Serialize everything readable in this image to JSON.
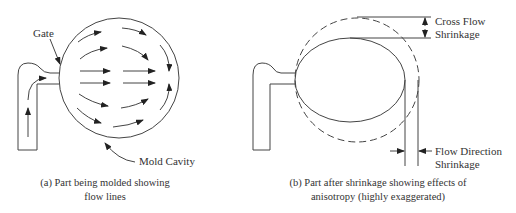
{
  "panel_a": {
    "labels": {
      "gate": "Gate",
      "mold_cavity": "Mold Cavity"
    },
    "caption_line1": "(a) Part being molded showing",
    "caption_line2": "flow lines"
  },
  "panel_b": {
    "labels": {
      "cross_flow_line1": "Cross Flow",
      "cross_flow_line2": "Shrinkage",
      "flow_dir_line1": "Flow Direction",
      "flow_dir_line2": "Shrinkage"
    },
    "caption_line1": "(b) Part after shrinkage showing effects of",
    "caption_line2": "anisotropy (highly exaggerated)"
  },
  "colors": {
    "line": "#444444",
    "text": "#333333"
  }
}
